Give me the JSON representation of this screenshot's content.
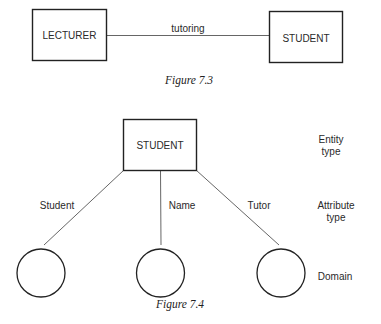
{
  "figure_7_3": {
    "entities": [
      "LECTURER",
      "STUDENT"
    ],
    "relationship": "tutoring",
    "caption": "Figure 7.3"
  },
  "figure_7_4": {
    "entity": "STUDENT",
    "attributes": [
      "Student",
      "Name",
      "Tutor"
    ],
    "legend": {
      "entity_type": [
        "Entity",
        "type"
      ],
      "attribute_type": [
        "Attribute",
        "type"
      ],
      "domain": "Domain"
    },
    "caption": "Figure 7.4"
  }
}
